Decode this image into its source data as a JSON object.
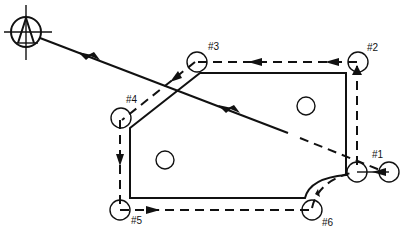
{
  "diagram": {
    "title": "",
    "positions": [
      {
        "id": "p1",
        "label": "#1"
      },
      {
        "id": "p2",
        "label": "#2"
      },
      {
        "id": "p3",
        "label": "#3"
      },
      {
        "id": "p4",
        "label": "#4"
      },
      {
        "id": "p5",
        "label": "#5"
      },
      {
        "id": "p6",
        "label": "#6"
      }
    ],
    "start_symbol": "program-zero-target-icon",
    "colors": {
      "ink": "#111111",
      "background": "#ffffff"
    }
  }
}
